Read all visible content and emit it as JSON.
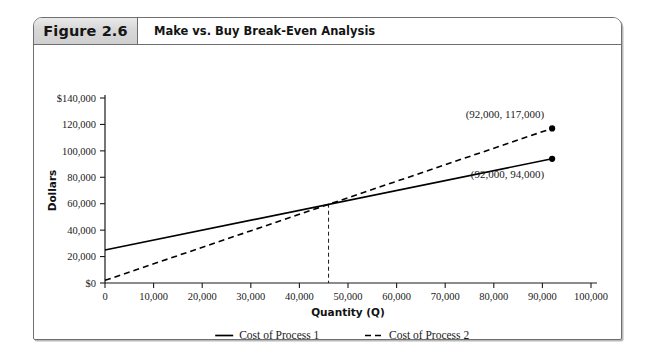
{
  "figure": {
    "tag": "Figure 2.6",
    "title": "Make vs. Buy Break-Even Analysis"
  },
  "chart_data": {
    "type": "line",
    "title": "Make vs. Buy Break-Even Analysis",
    "xlabel": "Quantity (Q)",
    "ylabel": "Dollars",
    "xlim": [
      0,
      100000
    ],
    "ylim": [
      0,
      140000
    ],
    "grid": false,
    "legend_position": "bottom-center",
    "x_ticks": [
      0,
      10000,
      20000,
      30000,
      40000,
      50000,
      60000,
      70000,
      80000,
      90000,
      100000
    ],
    "x_tick_labels": [
      "0",
      "10,000",
      "20,000",
      "30,000",
      "40,000",
      "50,000",
      "60,000",
      "70,000",
      "80,000",
      "90,000",
      "100,000"
    ],
    "y_ticks": [
      0,
      20000,
      40000,
      60000,
      80000,
      100000,
      120000,
      140000
    ],
    "y_tick_labels": [
      "$0",
      "20,000",
      "40,000",
      "60,000",
      "80,000",
      "100,000",
      "120,000",
      "$140,000"
    ],
    "series": [
      {
        "name": "Cost of Process 1",
        "style": "solid",
        "color": "#000000",
        "x": [
          0,
          92000
        ],
        "y": [
          25000,
          94000
        ],
        "endpoint_marker": true
      },
      {
        "name": "Cost of Process 2",
        "style": "dashed",
        "color": "#000000",
        "x": [
          0,
          92000
        ],
        "y": [
          2000,
          117000
        ],
        "endpoint_marker": true
      }
    ],
    "annotations": [
      {
        "text": "(92,000,  117,000)",
        "x": 92000,
        "y": 117000,
        "anchor": "above-left"
      },
      {
        "text": "(92,000,  94,000)",
        "x": 92000,
        "y": 94000,
        "anchor": "below-left"
      }
    ],
    "break_even": {
      "x": 46000,
      "y": 60000,
      "style": "dashed-vertical"
    },
    "legend": [
      {
        "label": "Cost of Process 1",
        "style": "solid"
      },
      {
        "label": "Cost of Process 2",
        "style": "dashed"
      }
    ]
  }
}
